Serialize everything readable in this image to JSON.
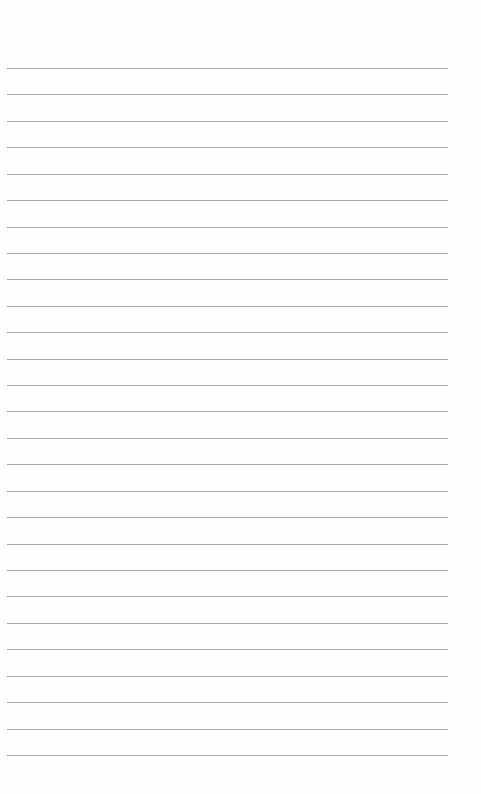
{
  "page": {
    "type": "lined-paper",
    "line_count": 27,
    "first_line_y": 68,
    "line_spacing": 26.42,
    "line_left": 7,
    "line_width": 441,
    "line_color": "#a9a9a9",
    "background": "#fefefe"
  }
}
